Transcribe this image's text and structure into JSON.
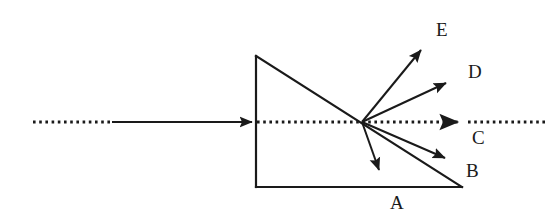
{
  "figure": {
    "stroke_color": "#1a1a1a",
    "background_color": "#ffffff",
    "width": 559,
    "height": 221
  },
  "prism": {
    "name": "right-triangle-prism",
    "vertices": [
      {
        "label": "top-left",
        "x": 256,
        "y": 56
      },
      {
        "label": "bottom-left",
        "x": 256,
        "y": 187
      },
      {
        "label": "bottom-right",
        "x": 462,
        "y": 187
      }
    ],
    "stroke_width": 2
  },
  "incident_ray": {
    "name": "incident-ray",
    "dotted_segment": {
      "x1": 33,
      "y1": 122,
      "x2": 112,
      "y2": 122
    },
    "solid_segment": {
      "x1": 112,
      "y1": 122,
      "x2": 254,
      "y2": 122
    },
    "arrow_tip": {
      "x": 254,
      "y": 122
    },
    "style": "dotted-then-solid-with-arrow"
  },
  "optical_axis": {
    "name": "optical-axis-dotted-line",
    "inside_prism": {
      "x1": 256,
      "y1": 122,
      "x2": 362,
      "y2": 122
    },
    "beyond_prism": {
      "x1": 462,
      "y1": 122,
      "x2": 545,
      "y2": 122
    },
    "style": "dotted"
  },
  "convergence_point": {
    "x": 362,
    "y": 122
  },
  "rays": [
    {
      "id": "A",
      "name": "ray-a",
      "from": {
        "x": 362,
        "y": 122
      },
      "to": {
        "x": 382,
        "y": 177
      },
      "label": "A",
      "label_x": 390,
      "label_y": 193,
      "direction": "down, steeply toward prism base"
    },
    {
      "id": "B",
      "name": "ray-b",
      "from": {
        "x": 362,
        "y": 122
      },
      "to": {
        "x": 451,
        "y": 161
      },
      "label": "B",
      "label_x": 466,
      "label_y": 161,
      "direction": "down-right, shallow"
    },
    {
      "id": "C",
      "name": "ray-c",
      "from": {
        "x": 362,
        "y": 122
      },
      "to": {
        "x": 462,
        "y": 122
      },
      "label": "C",
      "label_x": 472,
      "label_y": 128,
      "direction": "straight through, undeviated",
      "style": "dotted"
    },
    {
      "id": "D",
      "name": "ray-d",
      "from": {
        "x": 362,
        "y": 122
      },
      "to": {
        "x": 452,
        "y": 80
      },
      "label": "D",
      "label_x": 468,
      "label_y": 62,
      "direction": "up-right, shallow"
    },
    {
      "id": "E",
      "name": "ray-e",
      "from": {
        "x": 362,
        "y": 122
      },
      "to": {
        "x": 426,
        "y": 44
      },
      "label": "E",
      "label_x": 436,
      "label_y": 20,
      "direction": "up-right, steep"
    }
  ]
}
